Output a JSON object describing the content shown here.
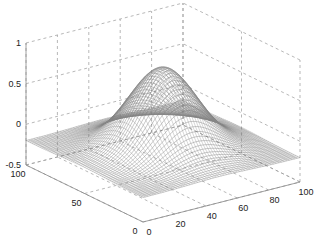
{
  "chart_data": {
    "type": "surface",
    "title": "",
    "xlabel": "",
    "ylabel": "",
    "zlabel": "",
    "x_ticks": [
      "0",
      "20",
      "40",
      "60",
      "80",
      "100"
    ],
    "y_ticks": [
      "0",
      "50",
      "100"
    ],
    "z_ticks": [
      "-0.5",
      "0",
      "0.5",
      "1"
    ],
    "xlim": [
      0,
      100
    ],
    "ylim": [
      0,
      100
    ],
    "zlim": [
      -0.5,
      1
    ],
    "grid": true,
    "peak": {
      "x": 50,
      "y": 50,
      "z": 0.8
    },
    "edge_min_z": -0.2,
    "mesh_color": "#555555"
  }
}
